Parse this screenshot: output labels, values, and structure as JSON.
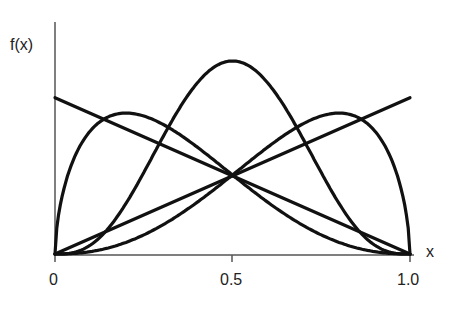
{
  "chart_data": {
    "type": "line",
    "title": "",
    "xlabel": "x",
    "ylabel": "f(x)",
    "xlim": [
      0,
      1.0
    ],
    "x_ticks": [
      "0",
      "0.5",
      "1.0"
    ],
    "y_ticks": [],
    "grid": false,
    "legend": null,
    "series": [
      {
        "name": "decreasing-line",
        "shape": "linear",
        "x": [
          0,
          1.0
        ],
        "y_rel": [
          0.81,
          0.0
        ]
      },
      {
        "name": "increasing-line",
        "shape": "linear",
        "x": [
          0,
          1.0
        ],
        "y_rel": [
          0.0,
          0.81
        ]
      },
      {
        "name": "symmetric-bell",
        "shape": "beta",
        "a": 4,
        "b": 4,
        "peak_x": 0.5,
        "peak_rel": 1.0
      },
      {
        "name": "left-skewed-hump",
        "shape": "beta",
        "a": 1.6,
        "b": 3.4,
        "peak_x": 0.2,
        "peak_rel": 0.73
      },
      {
        "name": "right-skewed-hump",
        "shape": "beta",
        "a": 3.4,
        "b": 1.6,
        "peak_x": 0.8,
        "peak_rel": 0.73
      }
    ]
  },
  "labels": {
    "ylabel": "f(x)",
    "xlabel": "x",
    "tick0": "0",
    "tick1": "0.5",
    "tick2": "1.0"
  }
}
